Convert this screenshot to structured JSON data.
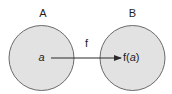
{
  "diagram": {
    "type": "function-mapping",
    "sets": [
      {
        "id": "A",
        "label": "A",
        "element": "a"
      },
      {
        "id": "B",
        "label": "B",
        "element_prefix": "f(",
        "element_var": "a",
        "element_suffix": ")"
      }
    ],
    "mapping": {
      "label": "f",
      "from": "a",
      "to": "f(a)"
    },
    "colors": {
      "circle_fill": "#e2e2e2",
      "circle_stroke": "#6a6a6a",
      "text": "#1e1e1e",
      "arrow": "#2a2a2a"
    }
  }
}
